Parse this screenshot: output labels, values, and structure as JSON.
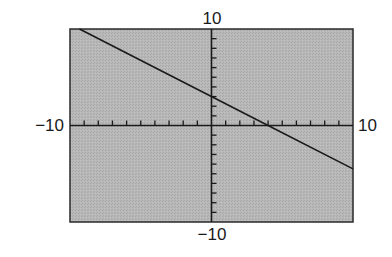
{
  "chart_data": {
    "type": "line",
    "title": "",
    "xlabel": "",
    "ylabel": "",
    "xlim": [
      -10,
      10
    ],
    "ylim": [
      -10,
      10
    ],
    "xscale": 1,
    "yscale": 1,
    "grid": false,
    "legend": null,
    "axis_labels": {
      "xmin": "−10",
      "xmax": "10",
      "ymin": "−10",
      "ymax": "10"
    },
    "series": [
      {
        "name": "line",
        "equation": "y = -0.75x + 3",
        "slope": -0.75,
        "intercept": 3,
        "x": [
          -9.33,
          4,
          10
        ],
        "y": [
          10,
          0,
          -4.5
        ]
      }
    ],
    "colors": {
      "background": "#b3b3b3",
      "line": "#1a1a1a",
      "axes": "#1a1a1a",
      "frame": "#2a2a2a"
    }
  }
}
